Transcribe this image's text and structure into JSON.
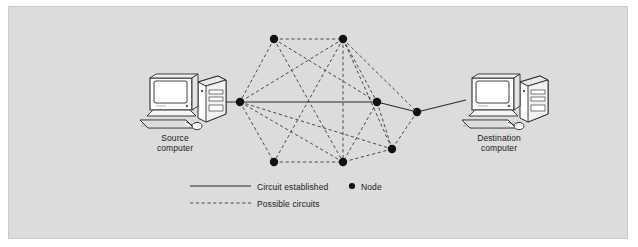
{
  "figure": {
    "background_color": "#dcdcdc",
    "border_color": "#c9c9c9",
    "line_color": "#333333",
    "node_color": "#111111"
  },
  "endpoints": [
    {
      "id": "source",
      "name": "source-computer",
      "label_line1": "Source",
      "label_line2": "computer",
      "x": 172,
      "y": 100
    },
    {
      "id": "destination",
      "name": "destination-computer",
      "label_line1": "Destination",
      "label_line2": "computer",
      "x": 492,
      "y": 100
    }
  ],
  "nodes": [
    {
      "id": "n1",
      "label": "top-left",
      "x": 274,
      "y": 39
    },
    {
      "id": "n2",
      "label": "top-right",
      "x": 343,
      "y": 39
    },
    {
      "id": "n3",
      "label": "left",
      "x": 240,
      "y": 102
    },
    {
      "id": "n4",
      "label": "right-center",
      "x": 377,
      "y": 102
    },
    {
      "id": "n5",
      "label": "far-right",
      "x": 417,
      "y": 112
    },
    {
      "id": "n6",
      "label": "lower-right",
      "x": 392,
      "y": 149
    },
    {
      "id": "n7",
      "label": "bottom-left",
      "x": 274,
      "y": 162
    },
    {
      "id": "n8",
      "label": "bottom-right",
      "x": 343,
      "y": 162
    }
  ],
  "circuit_established": {
    "style": "solid",
    "path": [
      "source",
      "n3",
      "n4",
      "n5",
      "destination"
    ]
  },
  "possible_circuits": {
    "style": "dashed",
    "edges": [
      [
        "n1",
        "n2"
      ],
      [
        "n1",
        "n3"
      ],
      [
        "n1",
        "n4"
      ],
      [
        "n1",
        "n8"
      ],
      [
        "n2",
        "n3"
      ],
      [
        "n2",
        "n4"
      ],
      [
        "n2",
        "n5"
      ],
      [
        "n2",
        "n7"
      ],
      [
        "n2",
        "n8"
      ],
      [
        "n2",
        "n6"
      ],
      [
        "n3",
        "n6"
      ],
      [
        "n3",
        "n7"
      ],
      [
        "n3",
        "n8"
      ],
      [
        "n4",
        "n6"
      ],
      [
        "n4",
        "n8"
      ],
      [
        "n5",
        "n6"
      ],
      [
        "n6",
        "n8"
      ],
      [
        "n7",
        "n8"
      ]
    ]
  },
  "legend": {
    "circuit_established": "Circuit established",
    "possible_circuits": "Possible circuits",
    "node": "Node",
    "solid_sample": {
      "x1": 190,
      "x2": 251,
      "y": 186
    },
    "dashed_sample": {
      "x1": 190,
      "x2": 251,
      "y": 203
    },
    "node_dot": {
      "x": 352,
      "y": 186,
      "r": 3
    }
  }
}
